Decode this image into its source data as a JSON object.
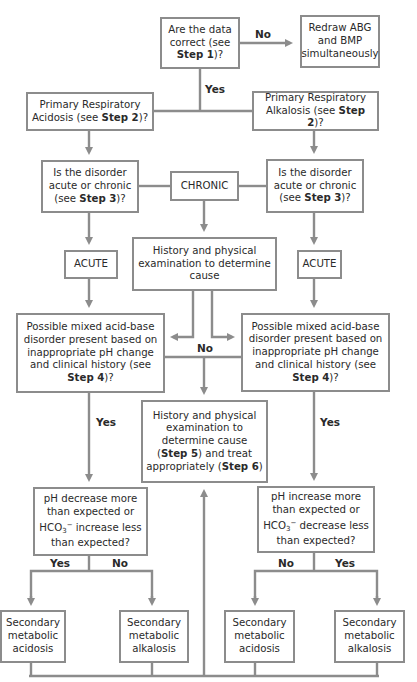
{
  "diagram": {
    "type": "flowchart",
    "colors": {
      "line": "#8c8c8c",
      "box_border": "#8c8c8c",
      "text": "#2a2a2a",
      "background": "#ffffff"
    },
    "nodes": {
      "data_correct": {
        "pre": "Are the data correct (see ",
        "bold": "Step 1",
        "post": ")?"
      },
      "redraw": {
        "text": "Redraw ABG and BMP simultaneously"
      },
      "resp_acidosis": {
        "pre": "Primary Respiratory Acidosis (see ",
        "bold": "Step 2",
        "post": ")?"
      },
      "resp_alkalosis": {
        "pre": "Primary Respiratory Alkalosis (see ",
        "bold": "Step 2",
        "post": ")?"
      },
      "acute_chronic_left": {
        "pre": "Is the disorder acute or chronic (see ",
        "bold": "Step 3",
        "post": ")?"
      },
      "chronic": {
        "text": "CHRONIC"
      },
      "acute_chronic_right": {
        "pre": "Is the disorder acute or chronic (see ",
        "bold": "Step 3",
        "post": ")?"
      },
      "acute_left": {
        "text": "ACUTE"
      },
      "history_1": {
        "text": "History and physical examination to determine cause"
      },
      "acute_right": {
        "text": "ACUTE"
      },
      "mixed_left": {
        "pre": "Possible mixed acid-base disorder present based on inappropriate pH change and clinical history (see ",
        "bold": "Step 4",
        "post": ")?"
      },
      "mixed_right": {
        "pre": "Possible mixed acid-base disorder present based on inappropriate pH change and clinical history (see ",
        "bold": "Step 4",
        "post": ")?"
      },
      "history_2": {
        "pre": "History and physical examination to determine cause (",
        "bold1": "Step 5",
        "mid": ") and treat appropriately (",
        "bold2": "Step 6",
        "post": ")"
      },
      "ph_decrease": {
        "pre": "pH decrease more than expected or HCO",
        "sub": "3",
        "sup": "−",
        "post": " increase less than expected?"
      },
      "ph_increase": {
        "pre": "pH increase more than expected or HCO",
        "sub": "3",
        "sup": "−",
        "post": " decrease less than expected?"
      },
      "sec_met_acidosis_1": {
        "text": "Secondary metabolic acidosis"
      },
      "sec_met_alkalosis_1": {
        "text": "Secondary metabolic alkalosis"
      },
      "sec_met_acidosis_2": {
        "text": "Secondary metabolic acidosis"
      },
      "sec_met_alkalosis_2": {
        "text": "Secondary metabolic alkalosis"
      }
    },
    "edge_labels": {
      "no_top": "No",
      "yes_top": "Yes",
      "no_middle": "No",
      "yes_left": "Yes",
      "yes_right": "Yes",
      "yes_bottom_left": "Yes",
      "no_bottom_left": "No",
      "no_bottom_right": "No",
      "yes_bottom_right": "Yes"
    }
  }
}
